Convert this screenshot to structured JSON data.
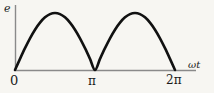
{
  "figure": {
    "kind": "full-wave-rectified-sine-waveform",
    "background_color": "#f7f6f2",
    "axis_color": "#8a8a8a",
    "curve_color": "#111111"
  },
  "labels": {
    "y_axis": "e",
    "x_axis": "ωt",
    "tick_origin": "0",
    "tick_pi": "π",
    "tick_2pi": "2π"
  },
  "chart_data": {
    "type": "line",
    "title": "",
    "xlabel": "ωt",
    "ylabel": "e",
    "grid": false,
    "legend": null,
    "xlim": [
      0,
      7.33
    ],
    "ylim": [
      0,
      1.12
    ],
    "xticks": [
      0,
      3.14159,
      6.28319
    ],
    "xticklabels": [
      "0",
      "π",
      "2π"
    ],
    "yticks": [],
    "yticklabels": [],
    "series": [
      {
        "name": "e = |sin(ωt)|",
        "x": [
          0.0,
          0.1963,
          0.3927,
          0.589,
          0.7854,
          0.9817,
          1.1781,
          1.3744,
          1.5708,
          1.7671,
          1.9635,
          2.1598,
          2.3562,
          2.5525,
          2.7489,
          2.9452,
          3.1416,
          3.3379,
          3.5343,
          3.7306,
          3.927,
          4.1233,
          4.3197,
          4.516,
          4.7124,
          4.9087,
          5.1051,
          5.3014,
          5.4978,
          5.6941,
          5.8905,
          6.0868,
          6.2832
        ],
        "y": [
          0.0,
          0.1951,
          0.3827,
          0.5556,
          0.7071,
          0.8315,
          0.9239,
          0.9808,
          1.0,
          0.9808,
          0.9239,
          0.8315,
          0.7071,
          0.5556,
          0.3827,
          0.1951,
          0.0,
          0.1951,
          0.3827,
          0.5556,
          0.7071,
          0.8315,
          0.9239,
          0.9808,
          1.0,
          0.9808,
          0.9239,
          0.8315,
          0.7071,
          0.5556,
          0.3827,
          0.1951,
          0.0
        ]
      }
    ],
    "annotations": [
      {
        "text": "e",
        "role": "y-axis-label"
      },
      {
        "text": "ωt",
        "role": "x-axis-label"
      }
    ]
  },
  "geometry": {
    "origin_px": {
      "x": 15,
      "y": 70
    },
    "x_axis_end_px": 196,
    "y_axis_top_px": 5,
    "pi_px": 93.5,
    "two_pi_px": 175,
    "peak_y_px": 13
  }
}
